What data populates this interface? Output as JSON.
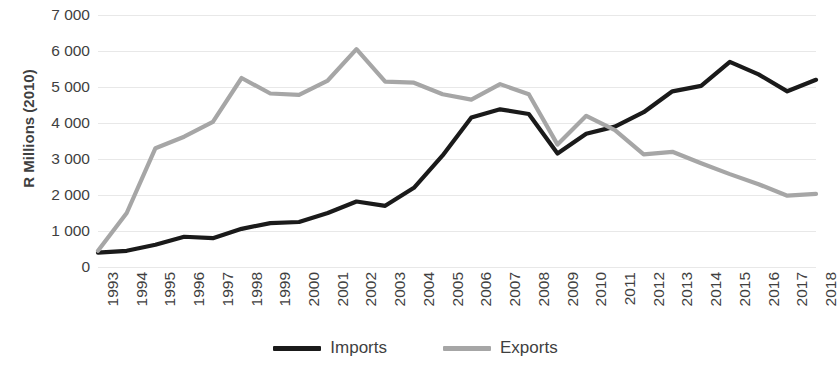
{
  "chart_data": {
    "type": "line",
    "title": "",
    "xlabel": "",
    "ylabel": "R Millions (2010)",
    "ylim": [
      0,
      7000
    ],
    "ytick_step": 1000,
    "grid": true,
    "legend_position": "bottom-center",
    "categories": [
      "1993",
      "1994",
      "1995",
      "1996",
      "1997",
      "1998",
      "1999",
      "2000",
      "2001",
      "2002",
      "2003",
      "2004",
      "2005",
      "2006",
      "2007",
      "2008",
      "2009",
      "2010",
      "2011",
      "2012",
      "2013",
      "2014",
      "2015",
      "2016",
      "2017",
      "2018"
    ],
    "ytick_labels": [
      "7 000",
      "6 000",
      "5 000",
      "4 000",
      "3 000",
      "2 000",
      "1 000",
      "0"
    ],
    "ytick_values": [
      7000,
      6000,
      5000,
      4000,
      3000,
      2000,
      1000,
      0
    ],
    "series": [
      {
        "name": "Imports",
        "color": "#1a1a1a",
        "values": [
          400,
          450,
          620,
          840,
          800,
          1060,
          1220,
          1250,
          1500,
          1820,
          1700,
          2200,
          3100,
          4150,
          4380,
          4250,
          3150,
          3700,
          3900,
          4300,
          4880,
          5030,
          5700,
          5350,
          4880,
          5200
        ]
      },
      {
        "name": "Exports",
        "color": "#a6a6a6",
        "values": [
          450,
          1500,
          3300,
          3620,
          4030,
          5250,
          4820,
          4780,
          5180,
          6050,
          5150,
          5120,
          4800,
          4650,
          5080,
          4800,
          3400,
          4200,
          3800,
          3130,
          3200,
          2880,
          2580,
          2300,
          1980,
          2030
        ]
      }
    ]
  },
  "legend": {
    "items": [
      {
        "label": "Imports",
        "color": "#1a1a1a",
        "icon": "line-swatch-black"
      },
      {
        "label": "Exports",
        "color": "#a6a6a6",
        "icon": "line-swatch-gray"
      }
    ]
  }
}
